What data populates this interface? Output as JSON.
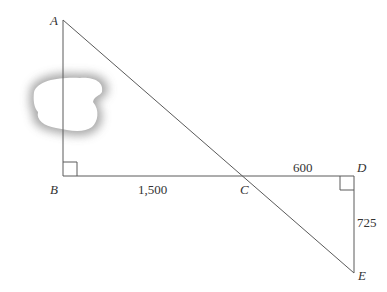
{
  "diagram": {
    "type": "similar-triangles-distance",
    "points": {
      "A": {
        "label": "A",
        "x": 63,
        "y": 20
      },
      "B": {
        "label": "B",
        "x": 63,
        "y": 176
      },
      "C": {
        "label": "C",
        "x": 251,
        "y": 176
      },
      "D": {
        "label": "D",
        "x": 354,
        "y": 176
      },
      "E": {
        "label": "E",
        "x": 354,
        "y": 273
      }
    },
    "segments": [
      {
        "from": "A",
        "to": "B"
      },
      {
        "from": "B",
        "to": "D"
      },
      {
        "from": "A",
        "to": "E"
      },
      {
        "from": "D",
        "to": "E"
      }
    ],
    "measurements": {
      "BC": "1,500",
      "CD": "600",
      "DE": "725"
    },
    "right_angles": [
      "B",
      "D"
    ],
    "obstacle": "lake"
  }
}
